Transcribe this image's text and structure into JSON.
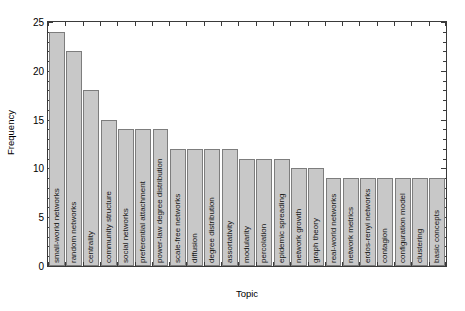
{
  "chart_data": {
    "type": "bar",
    "title": "",
    "xlabel": "Topic",
    "ylabel": "Frequency",
    "ylim": [
      0,
      25
    ],
    "yticks": [
      0,
      5,
      10,
      15,
      20,
      25
    ],
    "ytick_labels": [
      "0",
      "5",
      "10",
      "15",
      "20",
      "25"
    ],
    "minor_ytick_step": 1,
    "grid": false,
    "legend": null,
    "bar_color": "#c8c8c8",
    "bar_edge_color": "#7d7d7d",
    "axis_color": "#3a3a3a",
    "categories": [
      "small-world networks",
      "random networks",
      "centrality",
      "community structure",
      "social networks",
      "preferential attachment",
      "power-law degree distribution",
      "scale-free networks",
      "diffusion",
      "degree distribution",
      "assortativity",
      "modularity",
      "percolation",
      "epidemic spreading",
      "network growth",
      "graph theory",
      "real-world networks",
      "network metrics",
      "erdos-renyi networks",
      "contagion",
      "configuration model",
      "clustering",
      "basic concepts"
    ],
    "values": [
      24,
      22,
      18,
      15,
      14,
      14,
      14,
      12,
      12,
      12,
      12,
      11,
      11,
      11,
      10,
      10,
      9,
      9,
      9,
      9,
      9,
      9,
      9
    ]
  }
}
